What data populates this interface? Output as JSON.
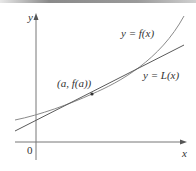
{
  "diagram": {
    "axes": {
      "x_label": "x",
      "y_label": "y",
      "origin_label": "0"
    },
    "curves": [
      {
        "name": "f",
        "label": "y = f(x)",
        "color": "#8a8a8a"
      },
      {
        "name": "L",
        "label": "y = L(x)",
        "color": "#5a5a5a"
      }
    ],
    "point": {
      "label": "(a, f(a))",
      "color": "#333333"
    }
  }
}
